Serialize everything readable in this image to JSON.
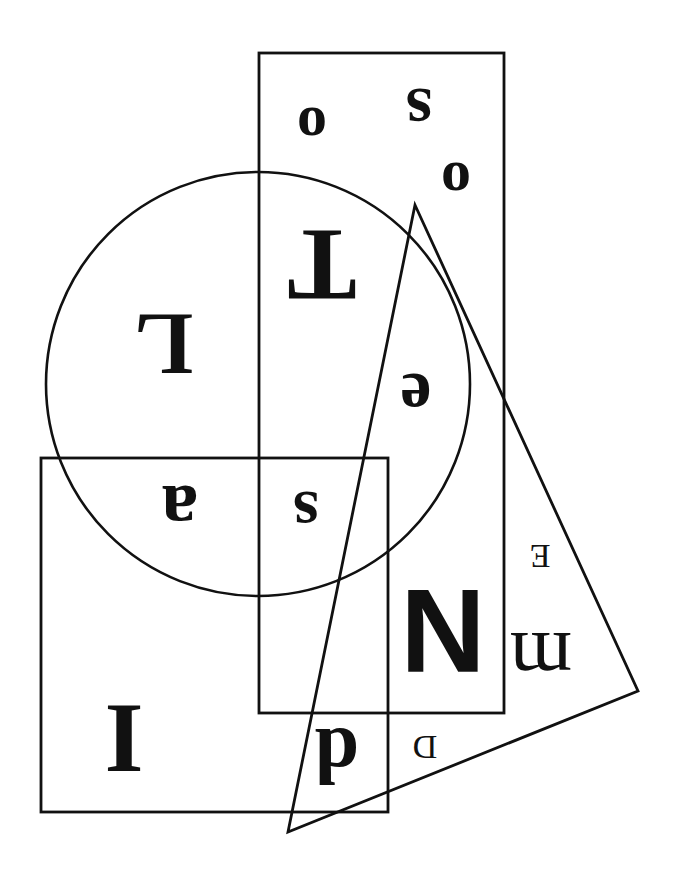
{
  "figure": {
    "width": 678,
    "height": 885,
    "background_color": "#ffffff",
    "ink_color": "#111111",
    "stroke_color": "#111111"
  },
  "shapes": [
    {
      "id": "circle",
      "name": "circle",
      "type": "circle",
      "cx": 258,
      "cy": 384,
      "r": 212,
      "stroke_width": 2.6,
      "fill": "none"
    },
    {
      "id": "upper-rectangle",
      "name": "tall-upper-rectangle",
      "type": "rect",
      "x": 259,
      "y": 53,
      "width": 245,
      "height": 660,
      "stroke_width": 2.8,
      "fill": "none"
    },
    {
      "id": "lower-rectangle",
      "name": "lower-left-rectangle",
      "type": "rect",
      "x": 41,
      "y": 458,
      "width": 347,
      "height": 354,
      "stroke_width": 2.8,
      "fill": "none"
    },
    {
      "id": "triangle",
      "name": "slanted-triangle",
      "type": "polygon",
      "points": "415,205 638,691 288,832",
      "stroke_width": 2.8,
      "fill": "none"
    }
  ],
  "letters": [
    {
      "id": "letter-o-top",
      "char": "o",
      "x": 312,
      "y": 128,
      "size": 60,
      "rotation": 180,
      "weight": "bold",
      "family": "serif",
      "name": "letter-o-upper-left"
    },
    {
      "id": "letter-s-top",
      "char": "s",
      "x": 419,
      "y": 112,
      "size": 68,
      "rotation": 180,
      "weight": "bold",
      "family": "serif",
      "name": "letter-s-upper-right"
    },
    {
      "id": "letter-o-right",
      "char": "o",
      "x": 456,
      "y": 183,
      "size": 60,
      "rotation": 180,
      "weight": "bold",
      "family": "serif",
      "name": "letter-o-right"
    },
    {
      "id": "letter-T",
      "char": "T",
      "x": 322,
      "y": 265,
      "size": 104,
      "rotation": 180,
      "weight": "bold",
      "family": "serif",
      "name": "letter-t-center"
    },
    {
      "id": "letter-L",
      "char": "L",
      "x": 164,
      "y": 344,
      "size": 88,
      "rotation": 180,
      "weight": "bold",
      "family": "serif",
      "name": "letter-l-left"
    },
    {
      "id": "letter-e",
      "char": "e",
      "x": 416,
      "y": 397,
      "size": 70,
      "rotation": 180,
      "weight": "bold",
      "family": "serif",
      "name": "letter-e-center-right"
    },
    {
      "id": "letter-a",
      "char": "a",
      "x": 180,
      "y": 511,
      "size": 74,
      "rotation": 180,
      "weight": "bold",
      "family": "serif",
      "name": "letter-a-left"
    },
    {
      "id": "letter-s-mid",
      "char": "s",
      "x": 306,
      "y": 514,
      "size": 66,
      "rotation": 180,
      "weight": "bold",
      "family": "serif",
      "name": "letter-s-middle"
    },
    {
      "id": "letter-E-small",
      "char": "E",
      "x": 540,
      "y": 556,
      "size": 34,
      "rotation": 180,
      "weight": "normal",
      "family": "serif",
      "name": "letter-e-small-right"
    },
    {
      "id": "letter-N",
      "char": "N",
      "x": 443,
      "y": 631,
      "size": 118,
      "rotation": 180,
      "weight": "bold",
      "family": "sans",
      "name": "letter-n-large"
    },
    {
      "id": "letter-m",
      "char": "m",
      "x": 541,
      "y": 660,
      "size": 80,
      "rotation": 180,
      "weight": "normal",
      "family": "serif",
      "name": "letter-m-right"
    },
    {
      "id": "letter-I",
      "char": "I",
      "x": 124,
      "y": 739,
      "size": 100,
      "rotation": 180,
      "weight": "bold",
      "family": "serif",
      "name": "letter-i-bottom-left"
    },
    {
      "id": "letter-d",
      "char": "d",
      "x": 337,
      "y": 756,
      "size": 80,
      "rotation": 180,
      "weight": "bold",
      "family": "serif",
      "name": "letter-d-bottom"
    },
    {
      "id": "letter-D-small",
      "char": "D",
      "x": 425,
      "y": 747,
      "size": 34,
      "rotation": 180,
      "weight": "normal",
      "family": "serif",
      "name": "letter-d-small-bottom"
    }
  ],
  "letters_reading_order": "o s o T L e a s E N m I d D",
  "counts": {
    "shape_count": 4,
    "letter_count": 14
  }
}
